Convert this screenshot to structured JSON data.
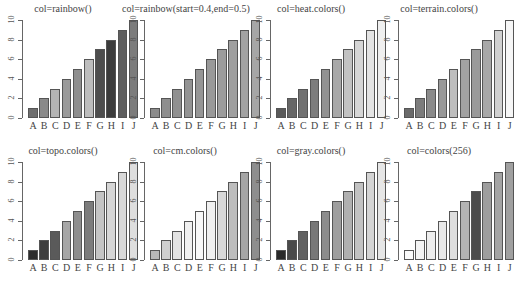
{
  "chart_data": [
    {
      "type": "bar",
      "title": "col=rainbow()",
      "categories": [
        "A",
        "B",
        "C",
        "D",
        "E",
        "F",
        "G",
        "H",
        "I",
        "J"
      ],
      "values": [
        1,
        2,
        3,
        4,
        5,
        6,
        7,
        8,
        9,
        10
      ],
      "ylim": [
        0,
        10
      ],
      "yticks": [
        0,
        2,
        4,
        6,
        8,
        10
      ],
      "colors": [
        "#6e6e6e",
        "#8a8a8a",
        "#b4b4b4",
        "#9a9a9a",
        "#8e8e8e",
        "#bdbdbd",
        "#4e4e4e",
        "#3c3c3c",
        "#5e5e5e",
        "#7c7c7c"
      ]
    },
    {
      "type": "bar",
      "title": "col=rainbow(start=0.4,end=0.5)",
      "categories": [
        "A",
        "B",
        "C",
        "D",
        "E",
        "F",
        "G",
        "H",
        "I",
        "J"
      ],
      "values": [
        1,
        2,
        3,
        4,
        5,
        6,
        7,
        8,
        9,
        10
      ],
      "ylim": [
        0,
        10
      ],
      "yticks": [
        0,
        2,
        4,
        6,
        8,
        10
      ],
      "colors": [
        "#8c8c8c",
        "#8e8e8e",
        "#909090",
        "#939393",
        "#969696",
        "#999999",
        "#9c9c9c",
        "#9f9f9f",
        "#a2a2a2",
        "#a6a6a6"
      ]
    },
    {
      "type": "bar",
      "title": "col=heat.colors()",
      "categories": [
        "A",
        "B",
        "C",
        "D",
        "E",
        "F",
        "G",
        "H",
        "I",
        "J"
      ],
      "values": [
        1,
        2,
        3,
        4,
        5,
        6,
        7,
        8,
        9,
        10
      ],
      "ylim": [
        0,
        10
      ],
      "yticks": [
        0,
        2,
        4,
        6,
        8,
        10
      ],
      "colors": [
        "#5a5a5a",
        "#666666",
        "#717171",
        "#7d7d7d",
        "#929292",
        "#a8a8a8",
        "#c2c2c2",
        "#d6d6d6",
        "#e4e4e4",
        "#efefef"
      ]
    },
    {
      "type": "bar",
      "title": "col=terrain.colors()",
      "categories": [
        "A",
        "B",
        "C",
        "D",
        "E",
        "F",
        "G",
        "H",
        "I",
        "J"
      ],
      "values": [
        1,
        2,
        3,
        4,
        5,
        6,
        7,
        8,
        9,
        10
      ],
      "ylim": [
        0,
        10
      ],
      "yticks": [
        0,
        2,
        4,
        6,
        8,
        10
      ],
      "colors": [
        "#6a6a6a",
        "#7c7c7c",
        "#8a8a8a",
        "#989898",
        "#bebebe",
        "#a2a2a2",
        "#9a9a9a",
        "#a8a8a8",
        "#d0d0d0",
        "#f6f6f6"
      ]
    },
    {
      "type": "bar",
      "title": "col=topo.colors()",
      "categories": [
        "A",
        "B",
        "C",
        "D",
        "E",
        "F",
        "G",
        "H",
        "I",
        "J"
      ],
      "values": [
        1,
        2,
        3,
        4,
        5,
        6,
        7,
        8,
        9,
        10
      ],
      "ylim": [
        0,
        10
      ],
      "yticks": [
        0,
        2,
        4,
        6,
        8,
        10
      ],
      "colors": [
        "#2e2e2e",
        "#3e3e3e",
        "#5a5a5a",
        "#a6a6a6",
        "#8e8e8e",
        "#7c7c7c",
        "#c4c4c4",
        "#d6d6d6",
        "#d8d8d8",
        "#dedede"
      ]
    },
    {
      "type": "bar",
      "title": "col=cm.colors()",
      "categories": [
        "A",
        "B",
        "C",
        "D",
        "E",
        "F",
        "G",
        "H",
        "I",
        "J"
      ],
      "values": [
        1,
        2,
        3,
        4,
        5,
        6,
        7,
        8,
        9,
        10
      ],
      "ylim": [
        0,
        10
      ],
      "yticks": [
        0,
        2,
        4,
        6,
        8,
        10
      ],
      "colors": [
        "#b8b8b8",
        "#cfcfcf",
        "#e3e3e3",
        "#f0f0f0",
        "#f8f8f8",
        "#f0f0f0",
        "#d8d8d8",
        "#bdbdbd",
        "#a6a6a6",
        "#8e8e8e"
      ]
    },
    {
      "type": "bar",
      "title": "col=gray.colors()",
      "categories": [
        "A",
        "B",
        "C",
        "D",
        "E",
        "F",
        "G",
        "H",
        "I",
        "J"
      ],
      "values": [
        1,
        2,
        3,
        4,
        5,
        6,
        7,
        8,
        9,
        10
      ],
      "ylim": [
        0,
        10
      ],
      "yticks": [
        0,
        2,
        4,
        6,
        8,
        10
      ],
      "colors": [
        "#2a2a2a",
        "#4a4a4a",
        "#626262",
        "#787878",
        "#8c8c8c",
        "#9e9e9e",
        "#b0b0b0",
        "#c2c2c2",
        "#d4d4d4",
        "#e6e6e6"
      ]
    },
    {
      "type": "bar",
      "title": "col=colors(256)",
      "categories": [
        "A",
        "B",
        "C",
        "D",
        "E",
        "F",
        "G",
        "H",
        "I",
        "J"
      ],
      "values": [
        1,
        2,
        3,
        4,
        5,
        6,
        7,
        8,
        9,
        10
      ],
      "ylim": [
        0,
        10
      ],
      "yticks": [
        0,
        2,
        4,
        6,
        8,
        10
      ],
      "colors": [
        "#fafafa",
        "#f4f4f4",
        "#eeeeee",
        "#e8e8e8",
        "#dedede",
        "#b4b4b4",
        "#4c4c4c",
        "#9e9e9e",
        "#a4a4a4",
        "#a0a0a0"
      ]
    }
  ],
  "caption": "图 5.9  不同颜色向量生成的条形图"
}
